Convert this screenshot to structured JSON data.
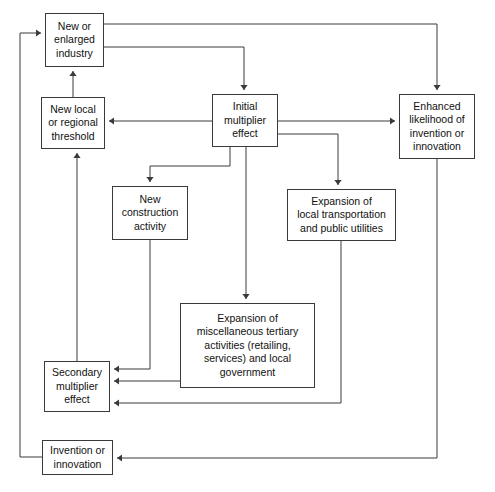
{
  "diagram": {
    "background_color": "#ffffff",
    "line_color": "#3a3a3a",
    "text_color": "#111111",
    "nodes": [
      {
        "id": "new-or-enlarged-industry",
        "label": "New or\nenlarged\nindustry",
        "x": 45,
        "y": 13,
        "w": 59,
        "h": 54
      },
      {
        "id": "new-local-or-regional-threshold",
        "label": "New local\nor regional\nthreshold",
        "x": 41,
        "y": 97,
        "w": 64,
        "h": 52
      },
      {
        "id": "initial-multiplier-effect",
        "label": "Initial\nmultiplier\neffect",
        "x": 212,
        "y": 94,
        "w": 66,
        "h": 53
      },
      {
        "id": "enhanced-likelihood-of-invention-or-innovation",
        "label": "Enhanced\nlikelihood of\ninvention or\ninnovation",
        "x": 399,
        "y": 94,
        "w": 76,
        "h": 65
      },
      {
        "id": "new-construction-activity",
        "label": "New\nconstruction\nactivity",
        "x": 112,
        "y": 186,
        "w": 76,
        "h": 54
      },
      {
        "id": "expansion-of-local-transportation-and-public-utilities",
        "label": "Expansion of\nlocal transportation\nand public utilities",
        "x": 287,
        "y": 189,
        "w": 109,
        "h": 52
      },
      {
        "id": "expansion-of-miscellaneous-tertiary-activities",
        "label": "Expansion of\nmiscellaneous tertiary\nactivities (retailing,\nservices) and local\ngovernment",
        "x": 180,
        "y": 303,
        "w": 135,
        "h": 85
      },
      {
        "id": "secondary-multiplier-effect",
        "label": "Secondary\nmultiplier\neffect",
        "x": 44,
        "y": 361,
        "w": 66,
        "h": 51
      },
      {
        "id": "invention-or-innovation",
        "label": "Invention or\ninnovation",
        "x": 42,
        "y": 440,
        "w": 71,
        "h": 35
      }
    ],
    "edges": [
      {
        "id": "industry-to-enhanced-likelihood",
        "from": "new-or-enlarged-industry",
        "to": "enhanced-likelihood-of-invention-or-innovation",
        "points": "104,24 437,24 437,90",
        "arrow": "down"
      },
      {
        "id": "industry-to-initial-multiplier",
        "from": "new-or-enlarged-industry",
        "to": "initial-multiplier-effect",
        "points": "104,47 244,47 244,90",
        "arrow": "down"
      },
      {
        "id": "threshold-to-industry",
        "from": "new-local-or-regional-threshold",
        "to": "new-or-enlarged-industry",
        "points": "73,97 73,71",
        "arrow": "up"
      },
      {
        "id": "initial-multiplier-to-threshold",
        "from": "initial-multiplier-effect",
        "to": "new-local-or-regional-threshold",
        "points": "212,121 109,121",
        "arrow": "left"
      },
      {
        "id": "initial-multiplier-to-enhanced-likelihood",
        "from": "initial-multiplier-effect",
        "to": "enhanced-likelihood-of-invention-or-innovation",
        "points": "278,121 395,121",
        "arrow": "right"
      },
      {
        "id": "initial-multiplier-to-new-construction",
        "from": "initial-multiplier-effect",
        "to": "new-construction-activity",
        "points": "230,147 230,166 150,166 150,182",
        "arrow": "down"
      },
      {
        "id": "initial-multiplier-to-expansion-transportation",
        "from": "initial-multiplier-effect",
        "to": "expansion-of-local-transportation-and-public-utilities",
        "points": "278,134 338,134 338,185",
        "arrow": "down"
      },
      {
        "id": "initial-multiplier-to-expansion-tertiary",
        "from": "initial-multiplier-effect",
        "to": "expansion-of-miscellaneous-tertiary-activities",
        "points": "246,147 246,299",
        "arrow": "down"
      },
      {
        "id": "new-construction-to-secondary-multiplier",
        "from": "new-construction-activity",
        "to": "secondary-multiplier-effect",
        "points": "150,240 150,369 114,369",
        "arrow": "left"
      },
      {
        "id": "expansion-tertiary-to-secondary-multiplier",
        "from": "expansion-of-miscellaneous-tertiary-activities",
        "to": "secondary-multiplier-effect",
        "points": "180,381 114,381",
        "arrow": "left"
      },
      {
        "id": "expansion-transportation-to-secondary-multiplier",
        "from": "expansion-of-local-transportation-and-public-utilities",
        "to": "secondary-multiplier-effect",
        "points": "341,241 341,403 114,403",
        "arrow": "left"
      },
      {
        "id": "secondary-multiplier-to-threshold",
        "from": "secondary-multiplier-effect",
        "to": "new-local-or-regional-threshold",
        "points": "77,361 77,153",
        "arrow": "up"
      },
      {
        "id": "enhanced-likelihood-to-invention",
        "from": "enhanced-likelihood-of-invention-or-innovation",
        "to": "invention-or-innovation",
        "points": "437,159 437,458 117,458",
        "arrow": "left"
      },
      {
        "id": "invention-to-industry",
        "from": "invention-or-innovation",
        "to": "new-or-enlarged-industry",
        "points": "42,457 20,457 20,33 41,33",
        "arrow": "right"
      }
    ]
  }
}
